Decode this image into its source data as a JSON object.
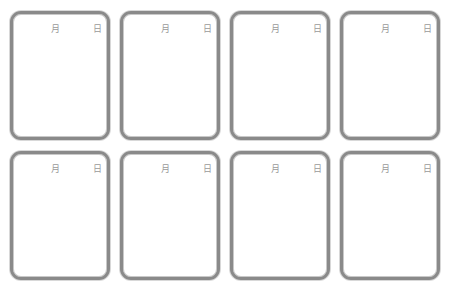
{
  "cards": [
    {
      "month_label": "月",
      "day_label": "日"
    },
    {
      "month_label": "月",
      "day_label": "日"
    },
    {
      "month_label": "月",
      "day_label": "日"
    },
    {
      "month_label": "月",
      "day_label": "日"
    },
    {
      "month_label": "月",
      "day_label": "日"
    },
    {
      "month_label": "月",
      "day_label": "日"
    },
    {
      "month_label": "月",
      "day_label": "日"
    },
    {
      "month_label": "月",
      "day_label": "日"
    }
  ],
  "colors": {
    "border": "#8a8a8a",
    "label": "#9a9a9a",
    "background": "#ffffff"
  }
}
